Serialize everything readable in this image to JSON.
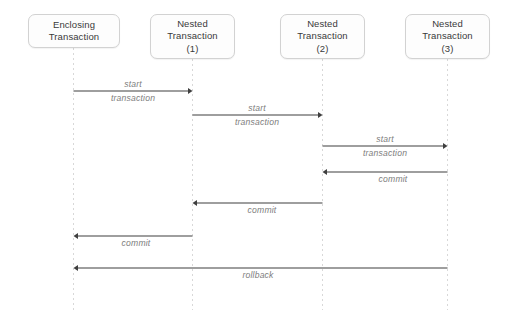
{
  "diagram": {
    "type": "uml-sequence-diagram",
    "width": 505,
    "height": 323,
    "background_color": "#ffffff",
    "line_color": "#3f3f3f",
    "lifeline_color": "#d8d8d8",
    "box_border_color": "#d2d2d2",
    "box_fill_color": "#fdfdfd",
    "box_text_color": "#3a3a3a",
    "label_color": "#7d7d7d"
  },
  "participants": [
    {
      "id": "enclosing",
      "lines": [
        "Enclosing",
        "Transaction"
      ],
      "x": 73.5,
      "box": {
        "left": 28,
        "top": 14,
        "width": 92,
        "height": 34
      },
      "lifeline": {
        "top": 48,
        "bottom": 310
      }
    },
    {
      "id": "nested1",
      "lines": [
        "Nested",
        "Transaction",
        "(1)"
      ],
      "x": 192.5,
      "box": {
        "left": 150,
        "top": 14,
        "width": 85,
        "height": 45
      },
      "lifeline": {
        "top": 59,
        "bottom": 310
      }
    },
    {
      "id": "nested2",
      "lines": [
        "Nested",
        "Transaction",
        "(2)"
      ],
      "x": 322.5,
      "box": {
        "left": 280,
        "top": 14,
        "width": 85,
        "height": 45
      },
      "lifeline": {
        "top": 59,
        "bottom": 310
      }
    },
    {
      "id": "nested3",
      "lines": [
        "Nested",
        "Transaction",
        "(3)"
      ],
      "x": 447.5,
      "box": {
        "left": 405,
        "top": 14,
        "width": 85,
        "height": 45
      },
      "lifeline": {
        "top": 59,
        "bottom": 310
      }
    }
  ],
  "messages": [
    {
      "id": "start-1",
      "label_lines": [
        "start",
        "transaction"
      ],
      "from": "enclosing",
      "to": "nested1",
      "x1": 73.5,
      "x2": 192.5,
      "y": 91,
      "direction": "right",
      "label_position": "split",
      "label_x": 133,
      "arrow_style": "solid"
    },
    {
      "id": "start-2",
      "label_lines": [
        "start",
        "transaction"
      ],
      "from": "nested1",
      "to": "nested2",
      "x1": 192.5,
      "x2": 322.5,
      "y": 115,
      "direction": "right",
      "label_position": "split",
      "label_x": 257,
      "arrow_style": "solid"
    },
    {
      "id": "start-3",
      "label_lines": [
        "start",
        "transaction"
      ],
      "from": "nested2",
      "to": "nested3",
      "x1": 322.5,
      "x2": 447.5,
      "y": 146,
      "direction": "right",
      "label_position": "split",
      "label_x": 385,
      "arrow_style": "solid"
    },
    {
      "id": "commit-3",
      "label_lines": [
        "commit"
      ],
      "from": "nested3",
      "to": "nested2",
      "x1": 447.5,
      "x2": 322.5,
      "y": 172,
      "direction": "left",
      "label_position": "below",
      "label_x": 393,
      "arrow_style": "solid"
    },
    {
      "id": "commit-2",
      "label_lines": [
        "commit"
      ],
      "from": "nested2",
      "to": "nested1",
      "x1": 322.5,
      "x2": 192.5,
      "y": 203,
      "direction": "left",
      "label_position": "below",
      "label_x": 262,
      "arrow_style": "solid"
    },
    {
      "id": "commit-1",
      "label_lines": [
        "commit"
      ],
      "from": "nested1",
      "to": "enclosing",
      "x1": 192.5,
      "x2": 73.5,
      "y": 236,
      "direction": "left",
      "label_position": "below",
      "label_x": 136,
      "arrow_style": "solid"
    },
    {
      "id": "rollback",
      "label_lines": [
        "rollback"
      ],
      "from": "nested3",
      "to": "enclosing",
      "x1": 447.5,
      "x2": 73.5,
      "y": 268,
      "direction": "left",
      "label_position": "below",
      "label_x": 258,
      "arrow_style": "solid"
    }
  ]
}
